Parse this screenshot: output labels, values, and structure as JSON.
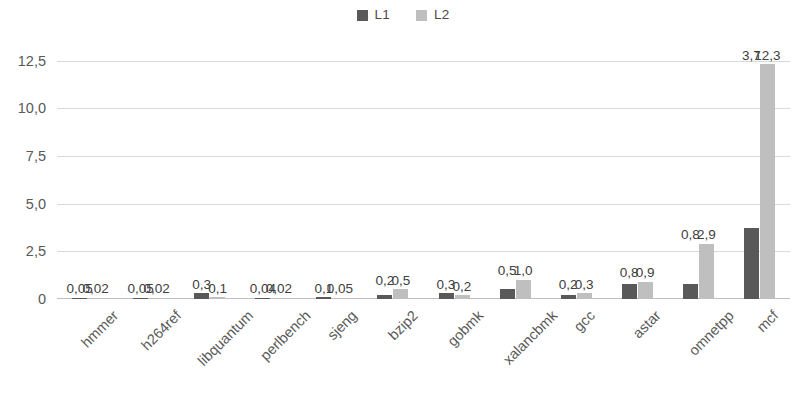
{
  "chart_data": {
    "type": "bar",
    "title": "",
    "subtitle": "",
    "xlabel": "",
    "ylabel": "",
    "ylim": [
      0,
      13.0
    ],
    "grid": true,
    "legend_position": "top-center",
    "decimal_separator": ",",
    "categories": [
      "hmmer",
      "h264ref",
      "libquantum",
      "perlbench",
      "sjeng",
      "bzip2",
      "gobmk",
      "xalancbmk",
      "gcc",
      "astar",
      "omnetpp",
      "mcf"
    ],
    "y_ticks": [
      0,
      2.5,
      5.0,
      7.5,
      10.0,
      12.5
    ],
    "y_tick_labels": [
      "0",
      "2,5",
      "5,0",
      "7,5",
      "10,0",
      "12,5"
    ],
    "series": [
      {
        "name": "L1",
        "color": "#595959",
        "values": [
          0.05,
          0.05,
          0.3,
          0.04,
          0.1,
          0.2,
          0.3,
          0.5,
          0.2,
          0.8,
          0.8,
          3.7
        ],
        "labels": [
          "0,05",
          "0,05",
          "0,3",
          "0,04",
          "0,1",
          "0,2",
          "0,3",
          "0,5",
          "0,2",
          "0,8",
          "0,8",
          "3,7"
        ]
      },
      {
        "name": "L2",
        "color": "#bfbfbf",
        "values": [
          0.02,
          0.02,
          0.1,
          0.02,
          0.05,
          0.5,
          0.2,
          1.0,
          0.3,
          0.9,
          2.9,
          12.3
        ],
        "labels": [
          "0,02",
          "0,02",
          "0,1",
          "0,02",
          "0,05",
          "0,5",
          "0,2",
          "1,0",
          "0,3",
          "0,9",
          "2,9",
          "12,3"
        ]
      }
    ]
  },
  "legend": {
    "entries": [
      {
        "label": "L1",
        "color": "#595959",
        "icon": "square-swatch-icon"
      },
      {
        "label": "L2",
        "color": "#bfbfbf",
        "icon": "square-swatch-icon"
      }
    ]
  }
}
